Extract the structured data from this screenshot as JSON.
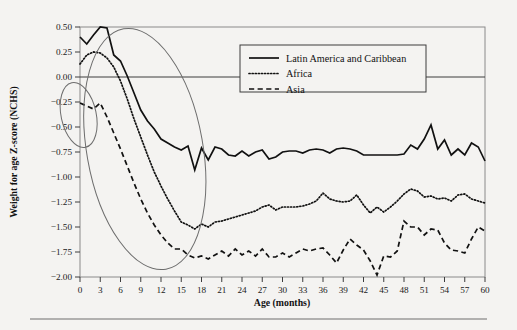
{
  "chart_data": {
    "type": "line",
    "title": "",
    "xlabel": "Age (months)",
    "ylabel": "Weight for age Z-score (NCHS)",
    "xlim": [
      0,
      60
    ],
    "ylim": [
      -2.0,
      0.5
    ],
    "grid": false,
    "zero_reference_line": 0.0,
    "legend_position": "top-right-inside",
    "xticks": [
      0,
      3,
      6,
      9,
      12,
      15,
      18,
      21,
      24,
      27,
      30,
      33,
      36,
      39,
      42,
      45,
      48,
      51,
      54,
      57,
      60
    ],
    "xtick_labels": [
      "0",
      "3",
      "6",
      "9",
      "12",
      "15",
      "18",
      "21",
      "24",
      "27",
      "30",
      "33",
      "36",
      "39",
      "42",
      "45",
      "48",
      "51",
      "54",
      "57",
      "60"
    ],
    "yticks": [
      0.5,
      0.25,
      0.0,
      -0.25,
      -0.5,
      -0.75,
      -1.0,
      -1.25,
      -1.5,
      -1.75,
      -2.0
    ],
    "ytick_labels": [
      "0.50",
      "0.25",
      "0.00",
      "−0.25",
      "−0.50",
      "−0.75",
      "−1.00",
      "−1.25",
      "−1.50",
      "−1.75",
      "−2.00"
    ],
    "x": [
      0,
      1,
      2,
      3,
      4,
      5,
      6,
      7,
      8,
      9,
      10,
      11,
      12,
      13,
      14,
      15,
      16,
      17,
      18,
      19,
      20,
      21,
      22,
      23,
      24,
      25,
      26,
      27,
      28,
      29,
      30,
      31,
      32,
      33,
      34,
      35,
      36,
      37,
      38,
      39,
      40,
      41,
      42,
      43,
      44,
      45,
      46,
      47,
      48,
      49,
      50,
      51,
      52,
      53,
      54,
      55,
      56,
      57,
      58,
      59,
      60
    ],
    "series": [
      {
        "name": "Latin America and Caribbean",
        "style": "solid",
        "color": "#111111",
        "values": [
          0.4,
          0.33,
          0.42,
          0.5,
          0.49,
          0.22,
          0.16,
          0.01,
          -0.16,
          -0.33,
          -0.44,
          -0.52,
          -0.62,
          -0.66,
          -0.7,
          -0.73,
          -0.69,
          -0.93,
          -0.71,
          -0.83,
          -0.7,
          -0.72,
          -0.78,
          -0.79,
          -0.74,
          -0.79,
          -0.75,
          -0.73,
          -0.82,
          -0.8,
          -0.75,
          -0.74,
          -0.74,
          -0.76,
          -0.73,
          -0.72,
          -0.73,
          -0.76,
          -0.72,
          -0.71,
          -0.72,
          -0.74,
          -0.78,
          -0.78,
          -0.78,
          -0.78,
          -0.78,
          -0.78,
          -0.77,
          -0.68,
          -0.72,
          -0.62,
          -0.48,
          -0.72,
          -0.63,
          -0.78,
          -0.72,
          -0.78,
          -0.66,
          -0.7,
          -0.84
        ]
      },
      {
        "name": "Africa",
        "style": "dotted",
        "color": "#111111",
        "values": [
          0.13,
          0.22,
          0.25,
          0.24,
          0.19,
          0.1,
          -0.04,
          -0.22,
          -0.42,
          -0.6,
          -0.78,
          -0.95,
          -1.09,
          -1.22,
          -1.34,
          -1.45,
          -1.48,
          -1.52,
          -1.47,
          -1.5,
          -1.45,
          -1.44,
          -1.42,
          -1.4,
          -1.38,
          -1.36,
          -1.34,
          -1.3,
          -1.28,
          -1.33,
          -1.3,
          -1.3,
          -1.3,
          -1.29,
          -1.27,
          -1.24,
          -1.16,
          -1.22,
          -1.24,
          -1.25,
          -1.24,
          -1.18,
          -1.28,
          -1.36,
          -1.3,
          -1.35,
          -1.3,
          -1.24,
          -1.17,
          -1.12,
          -1.14,
          -1.2,
          -1.19,
          -1.22,
          -1.21,
          -1.24,
          -1.18,
          -1.17,
          -1.22,
          -1.24,
          -1.26
        ]
      },
      {
        "name": "Asia",
        "style": "dashed",
        "color": "#111111",
        "values": [
          -0.26,
          -0.29,
          -0.32,
          -0.26,
          -0.4,
          -0.56,
          -0.72,
          -0.89,
          -1.06,
          -1.22,
          -1.36,
          -1.48,
          -1.58,
          -1.66,
          -1.72,
          -1.72,
          -1.78,
          -1.81,
          -1.79,
          -1.82,
          -1.78,
          -1.74,
          -1.79,
          -1.72,
          -1.78,
          -1.74,
          -1.79,
          -1.72,
          -1.8,
          -1.8,
          -1.76,
          -1.8,
          -1.76,
          -1.72,
          -1.74,
          -1.72,
          -1.71,
          -1.78,
          -1.86,
          -1.73,
          -1.62,
          -1.68,
          -1.73,
          -1.84,
          -1.98,
          -1.79,
          -1.8,
          -1.74,
          -1.44,
          -1.5,
          -1.5,
          -1.58,
          -1.52,
          -1.53,
          -1.66,
          -1.73,
          -1.74,
          -1.76,
          -1.62,
          -1.5,
          -1.54
        ]
      }
    ],
    "annotations": [
      {
        "name": "small-highlight-ellipse",
        "shape": "ellipse",
        "x_center_months": -0.2,
        "y_center_zscore": -0.38,
        "x_radius_months": 2.6,
        "y_radius_zscore": 0.33,
        "rotation_deg": -12
      },
      {
        "name": "large-highlight-ellipse",
        "shape": "ellipse",
        "x_center_months": 9.6,
        "y_center_zscore": -0.72,
        "x_radius_months": 8.6,
        "y_radius_zscore": 1.22,
        "rotation_deg": -10
      }
    ]
  },
  "legend": {
    "entries": [
      {
        "label": "Latin America and Caribbean",
        "style": "solid"
      },
      {
        "label": "Africa",
        "style": "dotted"
      },
      {
        "label": "Asia",
        "style": "dashed"
      }
    ]
  },
  "footer": {
    "rule_visible": true
  }
}
